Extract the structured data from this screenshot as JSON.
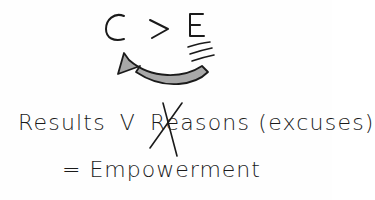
{
  "equation": {
    "left": "C",
    "operator": ">",
    "right": "E"
  },
  "arrow": {
    "direction": "right-to-left",
    "fill_color": "#a8a8a8",
    "stroke_color": "#1a1a1a"
  },
  "statement": {
    "results": "Results",
    "versus": "V",
    "reasons": "Reasons",
    "excuses": "(excuses)",
    "reasons_crossed_out": true
  },
  "conclusion": {
    "equals": "=",
    "word": "Empowerment"
  },
  "colors": {
    "ink": "#1a1a1a",
    "background": "#fefefe",
    "arrow_fill": "#a8a8a8"
  }
}
